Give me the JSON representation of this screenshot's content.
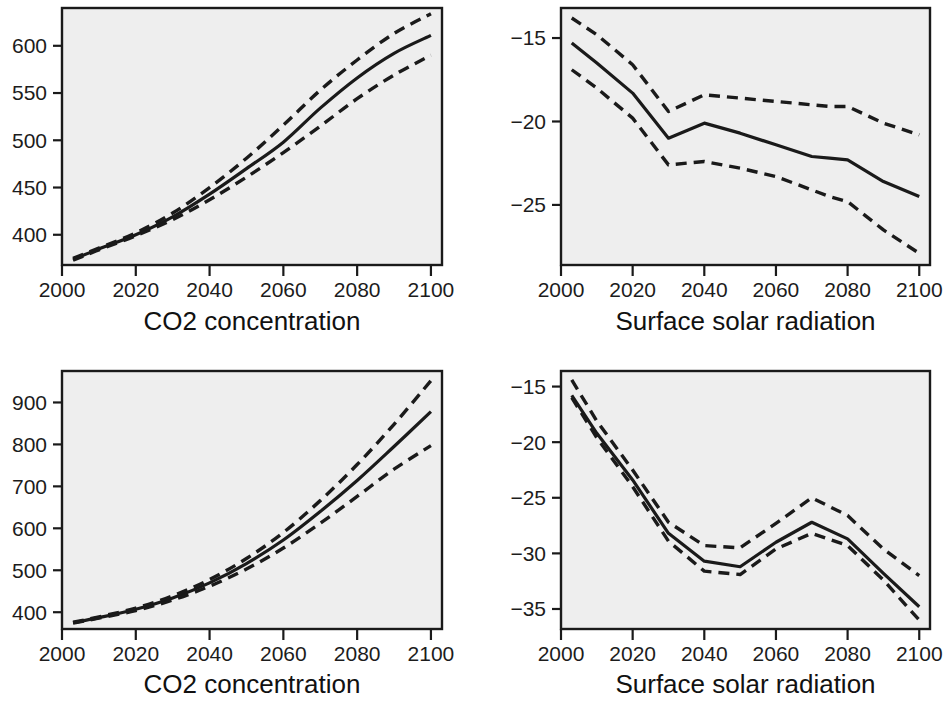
{
  "figure": {
    "layout": "2x2 panel grid",
    "background_color": "#ffffff",
    "plot_background_color": "#eeeeee",
    "line_color": "#1a1a1a"
  },
  "panels": [
    {
      "id": "top-left",
      "axis_title": "CO2 concentration",
      "x_tick_labels": [
        "2000",
        "2020",
        "2040",
        "2060",
        "2080",
        "2100"
      ],
      "y_tick_labels": [
        "400",
        "450",
        "500",
        "550",
        "600"
      ]
    },
    {
      "id": "top-right",
      "axis_title": "Surface solar radiation",
      "x_tick_labels": [
        "2000",
        "2020",
        "2040",
        "2060",
        "2080",
        "2100"
      ],
      "y_tick_labels": [
        "−15",
        "−20",
        "−25"
      ]
    },
    {
      "id": "bottom-left",
      "axis_title": "CO2 concentration",
      "x_tick_labels": [
        "2000",
        "2020",
        "2040",
        "2060",
        "2080",
        "2100"
      ],
      "y_tick_labels": [
        "400",
        "500",
        "600",
        "700",
        "800",
        "900"
      ]
    },
    {
      "id": "bottom-right",
      "axis_title": "Surface solar radiation",
      "x_tick_labels": [
        "2000",
        "2020",
        "2040",
        "2060",
        "2080",
        "2100"
      ],
      "y_tick_labels": [
        "−15",
        "−20",
        "−25",
        "−30",
        "−35"
      ]
    }
  ],
  "chart_data": [
    {
      "type": "line",
      "panel": "top-left",
      "title": "",
      "xlabel": "CO2 concentration",
      "ylabel": "",
      "xlim": [
        2000,
        2103
      ],
      "ylim": [
        368,
        640
      ],
      "xticks": [
        2000,
        2020,
        2040,
        2060,
        2080,
        2100
      ],
      "yticks": [
        400,
        450,
        500,
        550,
        600
      ],
      "grid": false,
      "legend": "none",
      "x": [
        2003,
        2010,
        2020,
        2030,
        2040,
        2050,
        2060,
        2070,
        2080,
        2090,
        2100
      ],
      "series": [
        {
          "name": "median",
          "style": "solid",
          "values": [
            374,
            385,
            400,
            419,
            443,
            470,
            498,
            534,
            566,
            592,
            611
          ]
        },
        {
          "name": "upper bound",
          "style": "dashed",
          "values": [
            375,
            386,
            402,
            423,
            450,
            481,
            516,
            553,
            585,
            613,
            634
          ]
        },
        {
          "name": "lower bound",
          "style": "dashed",
          "values": [
            373,
            384,
            399,
            416,
            437,
            461,
            487,
            515,
            544,
            569,
            590
          ]
        }
      ]
    },
    {
      "type": "line",
      "panel": "top-right",
      "title": "",
      "xlabel": "Surface solar radiation",
      "ylabel": "",
      "xlim": [
        2000,
        2103
      ],
      "ylim": [
        -28.6,
        -13.2
      ],
      "xticks": [
        2000,
        2020,
        2040,
        2060,
        2080,
        2100
      ],
      "yticks": [
        -15,
        -20,
        -25
      ],
      "grid": false,
      "legend": "none",
      "x": [
        2003,
        2010,
        2020,
        2030,
        2040,
        2050,
        2060,
        2070,
        2075,
        2080,
        2090,
        2100
      ],
      "series": [
        {
          "name": "median",
          "style": "solid",
          "values": [
            -15.3,
            -16.5,
            -18.3,
            -21.0,
            -20.1,
            -20.7,
            -21.4,
            -22.1,
            -22.2,
            -22.3,
            -23.6,
            -24.5
          ]
        },
        {
          "name": "upper bound",
          "style": "dashed",
          "values": [
            -13.8,
            -14.8,
            -16.6,
            -19.4,
            -18.4,
            -18.6,
            -18.8,
            -19.0,
            -19.1,
            -19.1,
            -20.1,
            -20.8
          ]
        },
        {
          "name": "lower bound",
          "style": "dashed",
          "values": [
            -16.9,
            -18.0,
            -19.8,
            -22.6,
            -22.4,
            -22.8,
            -23.3,
            -24.1,
            -24.5,
            -24.8,
            -26.5,
            -27.9
          ]
        }
      ]
    },
    {
      "type": "line",
      "panel": "bottom-left",
      "title": "",
      "xlabel": "CO2 concentration",
      "ylabel": "",
      "xlim": [
        2000,
        2103
      ],
      "ylim": [
        360,
        975
      ],
      "xticks": [
        2000,
        2020,
        2040,
        2060,
        2080,
        2100
      ],
      "yticks": [
        400,
        500,
        600,
        700,
        800,
        900
      ],
      "grid": false,
      "legend": "none",
      "x": [
        2003,
        2010,
        2020,
        2030,
        2040,
        2050,
        2060,
        2070,
        2080,
        2090,
        2100
      ],
      "series": [
        {
          "name": "median",
          "style": "solid",
          "values": [
            375,
            387,
            407,
            434,
            470,
            516,
            572,
            640,
            714,
            795,
            878
          ]
        },
        {
          "name": "upper bound",
          "style": "dashed",
          "values": [
            376,
            389,
            410,
            439,
            478,
            528,
            590,
            666,
            752,
            848,
            952
          ]
        },
        {
          "name": "lower bound",
          "style": "dashed",
          "values": [
            374,
            386,
            404,
            429,
            462,
            503,
            553,
            612,
            676,
            741,
            797
          ]
        }
      ]
    },
    {
      "type": "line",
      "panel": "bottom-right",
      "title": "",
      "xlabel": "Surface solar radiation",
      "ylabel": "",
      "xlim": [
        2000,
        2103
      ],
      "ylim": [
        -36.8,
        -13.6
      ],
      "xticks": [
        2000,
        2020,
        2040,
        2060,
        2080,
        2100
      ],
      "yticks": [
        -15,
        -20,
        -25,
        -30,
        -35
      ],
      "grid": false,
      "legend": "none",
      "x": [
        2003,
        2010,
        2020,
        2030,
        2040,
        2050,
        2060,
        2070,
        2080,
        2090,
        2100
      ],
      "series": [
        {
          "name": "median",
          "style": "solid",
          "values": [
            -15.8,
            -19.2,
            -23.4,
            -28.2,
            -30.7,
            -31.2,
            -29.0,
            -27.2,
            -28.7,
            -31.8,
            -34.8
          ]
        },
        {
          "name": "upper bound",
          "style": "dashed",
          "values": [
            -14.4,
            -18.1,
            -22.5,
            -27.2,
            -29.3,
            -29.5,
            -27.3,
            -25.0,
            -26.6,
            -29.6,
            -32.0
          ]
        },
        {
          "name": "lower bound",
          "style": "dashed",
          "values": [
            -16.0,
            -19.6,
            -24.0,
            -28.9,
            -31.6,
            -31.9,
            -29.6,
            -28.2,
            -29.3,
            -32.4,
            -36.0
          ]
        }
      ]
    }
  ]
}
